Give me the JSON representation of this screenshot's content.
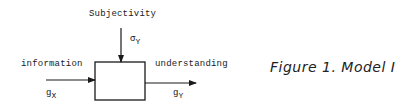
{
  "diagram": {
    "block": {
      "label": ""
    },
    "inputs": {
      "top": {
        "label": "Subjectivity",
        "symbol": "σ",
        "subscript": "Y"
      },
      "left": {
        "label": "information",
        "symbol": "g",
        "subscript": "X"
      }
    },
    "outputs": {
      "right": {
        "label": "understanding",
        "symbol": "g",
        "subscript": "Y"
      }
    },
    "caption": "Figure 1. Model I"
  },
  "colors": {
    "line": "#1a1a1a",
    "background": "#ffffff"
  }
}
